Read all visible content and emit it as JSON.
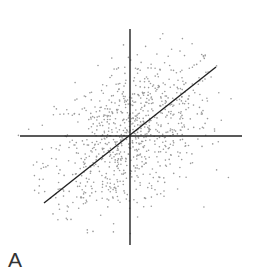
{
  "panel_label": "A",
  "chart_data": {
    "type": "scatter",
    "title": "",
    "xlabel": "",
    "ylabel": "",
    "center": [
      130,
      136
    ],
    "radius": 112,
    "point_count": 900,
    "point_color": "#999999",
    "axis_color": "#222222",
    "axes": {
      "horizontal": {
        "x1": 20,
        "y1": 136,
        "x2": 242,
        "y2": 136
      },
      "vertical": {
        "x1": 130,
        "y1": 29,
        "x2": 130,
        "y2": 245
      }
    },
    "regression_line": {
      "x1": 44,
      "y1": 203,
      "x2": 216,
      "y2": 67,
      "slope": 0.79
    },
    "grid": false,
    "legend": null
  }
}
